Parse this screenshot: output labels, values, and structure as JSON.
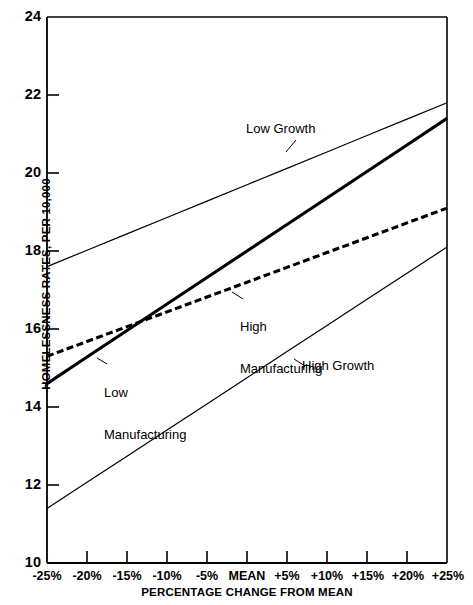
{
  "chart_data": {
    "type": "line",
    "title": "",
    "xlabel": "PERCENTAGE CHANGE FROM MEAN",
    "ylabel": "HOMELESSNESS RATES, PER 10,000",
    "x": [
      -25,
      -20,
      -15,
      -10,
      -5,
      0,
      5,
      10,
      15,
      20,
      25
    ],
    "xtick_labels": [
      "-25%",
      "-20%",
      "-15%",
      "-10%",
      "-5%",
      "MEAN",
      "+5%",
      "+10%",
      "+15%",
      "+20%",
      "+25%"
    ],
    "ytick_labels": [
      "24",
      "22",
      "20",
      "18",
      "16",
      "14",
      "12",
      "10"
    ],
    "yticks": [
      24,
      22,
      20,
      18,
      16,
      14,
      12,
      10
    ],
    "xlim": [
      -25,
      25
    ],
    "ylim": [
      10,
      24
    ],
    "grid": false,
    "legend": "inline-annotations",
    "series": [
      {
        "name": "Low Growth",
        "style": "thin-solid",
        "color": "#000000",
        "endpoints": [
          17.6,
          21.8
        ],
        "values": [
          17.6,
          18.02,
          18.44,
          18.86,
          19.28,
          19.7,
          20.12,
          20.54,
          20.96,
          21.38,
          21.8
        ]
      },
      {
        "name": "Low Manufacturing",
        "style": "thick-solid",
        "color": "#000000",
        "endpoints": [
          14.6,
          21.4
        ],
        "values": [
          14.6,
          15.28,
          15.96,
          16.64,
          17.32,
          18.0,
          18.68,
          19.36,
          20.04,
          20.72,
          21.4
        ]
      },
      {
        "name": "High Manufacturing",
        "style": "thick-dashed",
        "color": "#000000",
        "endpoints": [
          15.3,
          19.1
        ],
        "values": [
          15.3,
          15.68,
          16.06,
          16.44,
          16.82,
          17.2,
          17.58,
          17.96,
          18.34,
          18.72,
          19.1
        ]
      },
      {
        "name": "High Growth",
        "style": "thin-solid",
        "color": "#000000",
        "endpoints": [
          11.4,
          18.1
        ],
        "values": [
          11.4,
          12.07,
          12.74,
          13.41,
          14.08,
          14.75,
          15.42,
          16.09,
          16.76,
          17.43,
          18.1
        ]
      }
    ],
    "annotations": [
      {
        "text": "Low Growth",
        "series": "Low Growth"
      },
      {
        "text": "High\nManufacturing",
        "series": "High Manufacturing"
      },
      {
        "text": "Low\nManufacturing",
        "series": "Low Manufacturing"
      },
      {
        "text": "High Growth",
        "series": "High Growth"
      }
    ]
  },
  "axis": {
    "y_title": "HOMELESSNESS RATES, PER 10,000",
    "x_title": "PERCENTAGE CHANGE FROM MEAN"
  },
  "labels": {
    "low_growth": "Low Growth",
    "high_manufacturing_line1": "High",
    "high_manufacturing_line2": "Manufacturing",
    "low_manufacturing_line1": "Low",
    "low_manufacturing_line2": "Manufacturing",
    "high_growth": "High Growth"
  }
}
